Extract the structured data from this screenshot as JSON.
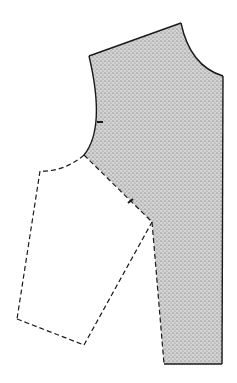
{
  "diagram": {
    "pieces": [
      {
        "name": "bodice",
        "style": "solid",
        "fill": "stippled",
        "notches": 2
      },
      {
        "name": "sleeve-outline",
        "style": "dashed",
        "fill": "none"
      }
    ],
    "colors": {
      "line": "#1a1a1a",
      "fill": "#c8c8c8",
      "background": "#ffffff"
    }
  }
}
